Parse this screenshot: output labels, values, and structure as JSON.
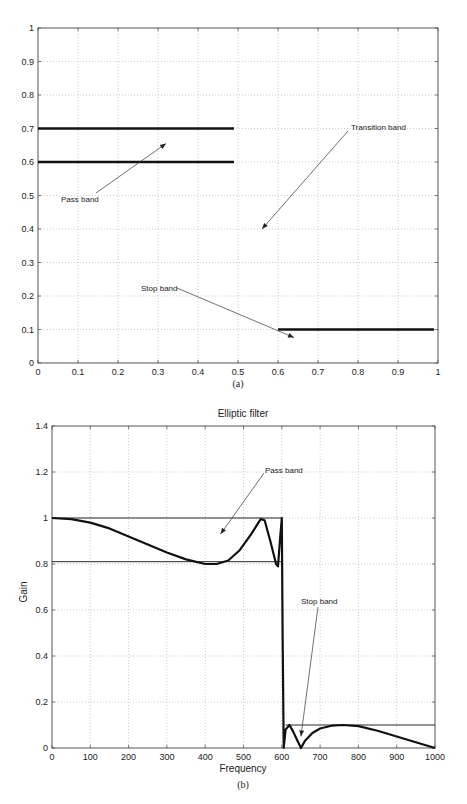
{
  "chart_data": [
    {
      "type": "line",
      "panel_caption": "(a)",
      "title": "",
      "xlabel": "",
      "ylabel": "",
      "xlim": [
        0,
        1
      ],
      "ylim": [
        0,
        1
      ],
      "xticks": [
        "0",
        "0.1",
        "0.2",
        "0.3",
        "0.4",
        "0.5",
        "0.6",
        "0.7",
        "0.8",
        "0.9",
        "1"
      ],
      "yticks": [
        "0",
        "0.1",
        "0.2",
        "0.3",
        "0.4",
        "0.5",
        "0.6",
        "0.7",
        "0.8",
        "0.9",
        "1"
      ],
      "grid": true,
      "series": [
        {
          "name": "Pass band upper",
          "x": [
            0,
            0.49
          ],
          "y": [
            0.7,
            0.7
          ]
        },
        {
          "name": "Pass band lower",
          "x": [
            0,
            0.49
          ],
          "y": [
            0.6,
            0.6
          ]
        },
        {
          "name": "Stop band",
          "x": [
            0.6,
            0.99
          ],
          "y": [
            0.1,
            0.1
          ]
        }
      ],
      "annotations": [
        {
          "text": "Pass band",
          "text_xy": [
            0.07,
            0.49
          ],
          "arrow_to": [
            0.32,
            0.655
          ]
        },
        {
          "text": "Transition band",
          "text_xy": [
            0.79,
            0.7
          ],
          "arrow_to": [
            0.56,
            0.4
          ]
        },
        {
          "text": "Stop band",
          "text_xy": [
            0.26,
            0.1
          ],
          "arrow_to": [
            0.64,
            0.076
          ]
        }
      ]
    },
    {
      "type": "line",
      "panel_caption": "(b)",
      "title": "Elliptic filter",
      "xlabel": "Frequency",
      "ylabel": "Gain",
      "xlim": [
        0,
        1000
      ],
      "ylim": [
        0,
        1.4
      ],
      "xticks": [
        "0",
        "100",
        "200",
        "300",
        "400",
        "500",
        "600",
        "700",
        "800",
        "900",
        "1000"
      ],
      "yticks": [
        "0",
        "0.2",
        "0.4",
        "0.6",
        "0.8",
        "1",
        "1.2",
        "1.4"
      ],
      "grid": true,
      "series": [
        {
          "name": "Elliptic filter gain",
          "x": [
            0,
            50,
            100,
            150,
            200,
            250,
            300,
            350,
            400,
            430,
            460,
            490,
            520,
            545,
            555,
            570,
            585,
            590,
            595,
            600,
            602,
            605,
            610,
            620,
            630,
            640,
            650,
            660,
            680,
            700,
            730,
            760,
            800,
            850,
            900,
            950,
            1000
          ],
          "y": [
            1.0,
            0.995,
            0.98,
            0.955,
            0.92,
            0.885,
            0.85,
            0.82,
            0.8,
            0.8,
            0.815,
            0.86,
            0.93,
            0.995,
            0.99,
            0.9,
            0.8,
            0.79,
            0.9,
            1.0,
            0.5,
            0.0,
            0.08,
            0.1,
            0.07,
            0.035,
            0.0,
            0.03,
            0.065,
            0.085,
            0.097,
            0.1,
            0.095,
            0.075,
            0.05,
            0.025,
            0.0
          ]
        },
        {
          "name": "Pass band upper bound",
          "x": [
            0,
            600
          ],
          "y": [
            1.0,
            1.0
          ]
        },
        {
          "name": "Pass band lower bound",
          "x": [
            0,
            600
          ],
          "y": [
            0.81,
            0.81
          ]
        },
        {
          "name": "Stop band bound",
          "x": [
            610,
            1000
          ],
          "y": [
            0.1,
            0.1
          ]
        }
      ],
      "annotations": [
        {
          "text": "Pass band",
          "text_xy": [
            555,
            1.2
          ],
          "arrow_to": [
            440,
            0.93
          ]
        },
        {
          "text": "Stop band",
          "text_xy": [
            655,
            0.52
          ],
          "arrow_to": [
            650,
            0.05
          ]
        }
      ]
    }
  ]
}
